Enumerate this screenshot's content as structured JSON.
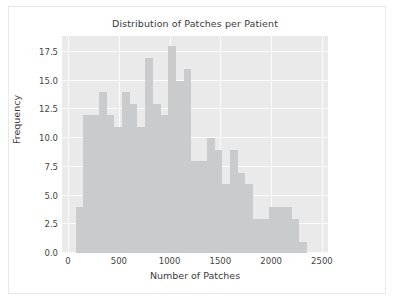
{
  "chart_data": {
    "type": "bar",
    "title": "Distribution of Patches per Patient",
    "xlabel": "Number of Patches",
    "ylabel": "Frequency",
    "xlim": [
      -60,
      2560
    ],
    "ylim": [
      0,
      18.9
    ],
    "grid": true,
    "legend": null,
    "xticks": [
      0,
      500,
      1000,
      1500,
      2000,
      2500
    ],
    "xtick_labels": [
      "0",
      "500",
      "1000",
      "1500",
      "2000",
      "2500"
    ],
    "yticks": [
      0.0,
      2.5,
      5.0,
      7.5,
      10.0,
      12.5,
      15.0,
      17.5
    ],
    "ytick_labels": [
      "0.0",
      "2.5",
      "5.0",
      "7.5",
      "10.0",
      "12.5",
      "15.0",
      "17.5"
    ],
    "bin_width": 76,
    "bin_starts": [
      75,
      151,
      227,
      303,
      379,
      455,
      531,
      607,
      683,
      759,
      835,
      911,
      987,
      1063,
      1139,
      1215,
      1291,
      1367,
      1443,
      1519,
      1595,
      1671,
      1747,
      1823,
      1899,
      1975,
      2051,
      2127,
      2203,
      2279
    ],
    "bin_centers": [
      113,
      189,
      265,
      341,
      417,
      493,
      569,
      645,
      721,
      797,
      873,
      949,
      1025,
      1101,
      1177,
      1253,
      1329,
      1405,
      1481,
      1557,
      1633,
      1709,
      1785,
      1861,
      1937,
      2013,
      2089,
      2165,
      2241,
      2317
    ],
    "values": [
      4,
      12,
      12,
      14,
      12,
      11,
      14,
      13,
      11,
      17,
      13,
      12,
      18,
      15,
      16,
      8,
      8,
      10,
      9,
      6,
      9,
      7,
      6,
      3,
      3,
      4,
      4,
      4,
      3,
      1
    ],
    "bar_color": "#c9cbcc",
    "plot_background": "#eaeaea",
    "grid_color": "#fbfbfb",
    "figure_background": "#ffffff"
  }
}
